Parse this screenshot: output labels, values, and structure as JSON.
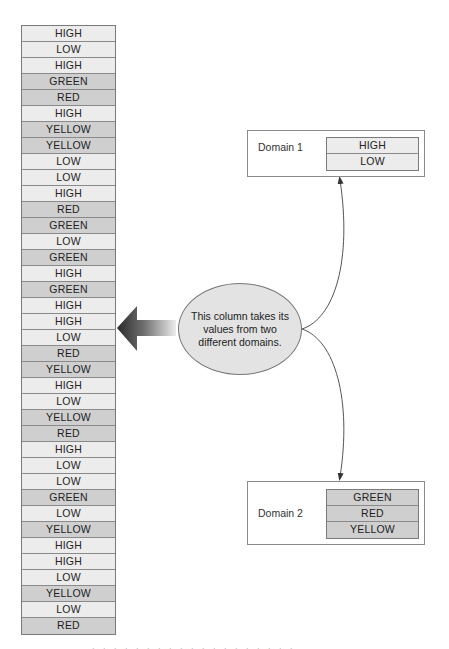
{
  "column": {
    "values": [
      {
        "text": "HIGH",
        "domain": 1
      },
      {
        "text": "LOW",
        "domain": 1
      },
      {
        "text": "HIGH",
        "domain": 1
      },
      {
        "text": "GREEN",
        "domain": 2
      },
      {
        "text": "RED",
        "domain": 2
      },
      {
        "text": "HIGH",
        "domain": 1
      },
      {
        "text": "YELLOW",
        "domain": 2
      },
      {
        "text": "YELLOW",
        "domain": 2
      },
      {
        "text": "LOW",
        "domain": 1
      },
      {
        "text": "LOW",
        "domain": 1
      },
      {
        "text": "HIGH",
        "domain": 1
      },
      {
        "text": "RED",
        "domain": 2
      },
      {
        "text": "GREEN",
        "domain": 2
      },
      {
        "text": "LOW",
        "domain": 1
      },
      {
        "text": "GREEN",
        "domain": 2
      },
      {
        "text": "HIGH",
        "domain": 1
      },
      {
        "text": "GREEN",
        "domain": 2
      },
      {
        "text": "HIGH",
        "domain": 1
      },
      {
        "text": "HIGH",
        "domain": 1
      },
      {
        "text": "LOW",
        "domain": 1
      },
      {
        "text": "RED",
        "domain": 2
      },
      {
        "text": "YELLOW",
        "domain": 2
      },
      {
        "text": "HIGH",
        "domain": 1
      },
      {
        "text": "LOW",
        "domain": 1
      },
      {
        "text": "YELLOW",
        "domain": 2
      },
      {
        "text": "RED",
        "domain": 2
      },
      {
        "text": "HIGH",
        "domain": 1
      },
      {
        "text": "LOW",
        "domain": 1
      },
      {
        "text": "LOW",
        "domain": 1
      },
      {
        "text": "GREEN",
        "domain": 2
      },
      {
        "text": "LOW",
        "domain": 1
      },
      {
        "text": "YELLOW",
        "domain": 2
      },
      {
        "text": "HIGH",
        "domain": 1
      },
      {
        "text": "HIGH",
        "domain": 1
      },
      {
        "text": "LOW",
        "domain": 1
      },
      {
        "text": "YELLOW",
        "domain": 2
      },
      {
        "text": "LOW",
        "domain": 1
      },
      {
        "text": "RED",
        "domain": 2
      }
    ]
  },
  "callout": {
    "text": "This column takes its values from two different domains."
  },
  "domains": [
    {
      "label": "Domain 1",
      "values": [
        "HIGH",
        "LOW"
      ]
    },
    {
      "label": "Domain 2",
      "values": [
        "GREEN",
        "RED",
        "YELLOW"
      ]
    }
  ],
  "colors": {
    "domain1_cell": "#ececec",
    "domain2_cell": "#cfcfcf",
    "border": "#7a7a7a",
    "ellipse_fill": "#e3e3e3",
    "arrow_dark": "#2a2a2a",
    "arrow_light": "#e8e8e8"
  }
}
